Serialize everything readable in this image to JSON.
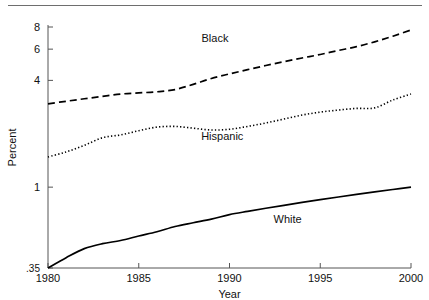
{
  "chart_data": {
    "type": "line",
    "title": "",
    "xlabel": "Year",
    "ylabel": "Percent",
    "yscale": "log",
    "ylim": [
      0.35,
      8
    ],
    "xlim": [
      1980,
      2000
    ],
    "grid": false,
    "legend_position": "inline-annotation",
    "y_ticks": [
      {
        "value": 0.35,
        "label": ".35"
      },
      {
        "value": 1,
        "label": "1"
      },
      {
        "value": 4,
        "label": "4"
      },
      {
        "value": 6,
        "label": "6"
      },
      {
        "value": 8,
        "label": "8"
      }
    ],
    "x_ticks": [
      {
        "value": 1980,
        "label": "1980"
      },
      {
        "value": 1985,
        "label": "1985"
      },
      {
        "value": 1990,
        "label": "1990"
      },
      {
        "value": 1995,
        "label": "1995"
      },
      {
        "value": 2000,
        "label": "2000"
      }
    ],
    "x": [
      1980,
      1981,
      1982,
      1983,
      1984,
      1985,
      1986,
      1987,
      1988,
      1989,
      1990,
      1991,
      1992,
      1993,
      1994,
      1995,
      1996,
      1997,
      1998,
      1999,
      2000
    ],
    "series": [
      {
        "name": "Black",
        "style": "dashed",
        "color": "#000000",
        "label_x": 1989.2,
        "label_y": 6.6,
        "values": [
          2.95,
          3.05,
          3.15,
          3.25,
          3.35,
          3.4,
          3.45,
          3.55,
          3.8,
          4.1,
          4.35,
          4.6,
          4.85,
          5.1,
          5.35,
          5.6,
          5.9,
          6.2,
          6.6,
          7.1,
          7.7
        ]
      },
      {
        "name": "Hispanic",
        "style": "dotted",
        "color": "#000000",
        "label_x": 1989.6,
        "label_y": 1.85,
        "values": [
          1.48,
          1.58,
          1.72,
          1.9,
          1.97,
          2.08,
          2.18,
          2.2,
          2.15,
          2.1,
          2.12,
          2.2,
          2.3,
          2.42,
          2.55,
          2.65,
          2.72,
          2.78,
          2.8,
          3.1,
          3.35
        ]
      },
      {
        "name": "White",
        "style": "solid",
        "color": "#000000",
        "label_x": 1993.2,
        "label_y": 0.63,
        "values": [
          0.35,
          0.4,
          0.45,
          0.48,
          0.5,
          0.53,
          0.56,
          0.6,
          0.63,
          0.66,
          0.7,
          0.73,
          0.76,
          0.79,
          0.82,
          0.85,
          0.88,
          0.91,
          0.94,
          0.97,
          1.0
        ]
      }
    ]
  }
}
